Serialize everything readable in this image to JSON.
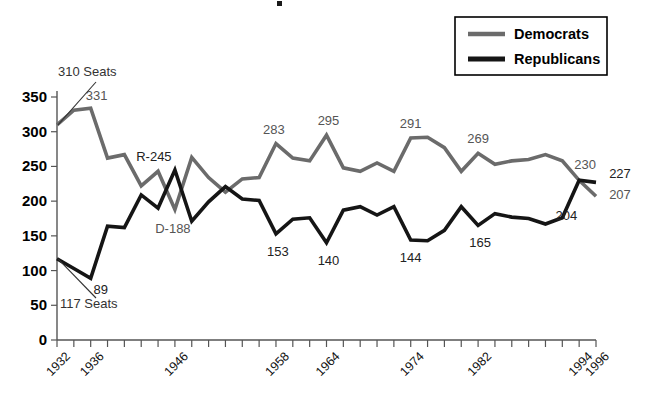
{
  "chart_data": {
    "type": "line",
    "title": "",
    "xlabel": "",
    "ylabel": "",
    "ylim": [
      0,
      350
    ],
    "ytick_values": [
      0,
      50,
      100,
      150,
      200,
      250,
      300,
      350
    ],
    "ytick_labels": [
      "0",
      "50",
      "100",
      "150",
      "200",
      "250",
      "300",
      "350"
    ],
    "grid": false,
    "legend_position": "top-right",
    "x": [
      1932,
      1934,
      1936,
      1938,
      1940,
      1942,
      1944,
      1946,
      1948,
      1950,
      1952,
      1954,
      1956,
      1958,
      1960,
      1962,
      1964,
      1966,
      1968,
      1970,
      1972,
      1974,
      1976,
      1978,
      1980,
      1982,
      1984,
      1986,
      1988,
      1990,
      1992,
      1994,
      1996
    ],
    "xtick_values": [
      1932,
      1934,
      1936,
      1938,
      1940,
      1942,
      1944,
      1946,
      1948,
      1950,
      1952,
      1954,
      1956,
      1958,
      1960,
      1962,
      1964,
      1966,
      1968,
      1970,
      1972,
      1974,
      1976,
      1978,
      1980,
      1982,
      1984,
      1986,
      1988,
      1990,
      1992,
      1994,
      1996
    ],
    "xtick_labels_shown": [
      "1932",
      "1936",
      "1946",
      "1958",
      "1964",
      "1974",
      "1982",
      "1994",
      "1996"
    ],
    "series": [
      {
        "name": "Democrats",
        "color": "#6b6b6b",
        "values": [
          310,
          331,
          334,
          262,
          267,
          222,
          243,
          188,
          263,
          234,
          213,
          232,
          234,
          283,
          262,
          258,
          295,
          248,
          243,
          255,
          243,
          291,
          292,
          277,
          243,
          269,
          253,
          258,
          260,
          267,
          258,
          230,
          207
        ]
      },
      {
        "name": "Republicans",
        "color": "#151515",
        "values": [
          117,
          103,
          89,
          164,
          162,
          209,
          190,
          245,
          171,
          199,
          221,
          203,
          201,
          153,
          174,
          176,
          140,
          187,
          192,
          180,
          192,
          144,
          143,
          158,
          192,
          165,
          182,
          177,
          175,
          167,
          176,
          230,
          227
        ]
      }
    ],
    "data_labels": [
      {
        "text": "331",
        "series": "Democrats",
        "x": 1936,
        "value": 331
      },
      {
        "text": "283",
        "series": "Democrats",
        "x": 1958,
        "value": 283
      },
      {
        "text": "295",
        "series": "Democrats",
        "x": 1964,
        "value": 295
      },
      {
        "text": "291",
        "series": "Democrats",
        "x": 1974,
        "value": 291
      },
      {
        "text": "269",
        "series": "Democrats",
        "x": 1982,
        "value": 269
      },
      {
        "text": "230",
        "series": "Democrats",
        "x": 1994,
        "value": 230
      },
      {
        "text": "207",
        "series": "Democrats",
        "x": 1996,
        "value": 207
      },
      {
        "text": "89",
        "series": "Republicans",
        "x": 1936,
        "value": 89
      },
      {
        "text": "153",
        "series": "Republicans",
        "x": 1958,
        "value": 153
      },
      {
        "text": "140",
        "series": "Republicans",
        "x": 1964,
        "value": 140
      },
      {
        "text": "144",
        "series": "Republicans",
        "x": 1974,
        "value": 144
      },
      {
        "text": "165",
        "series": "Republicans",
        "x": 1982,
        "value": 165
      },
      {
        "text": "204",
        "series": "Republicans",
        "x": 1992,
        "value": 204
      },
      {
        "text": "227",
        "series": "Republicans",
        "x": 1996,
        "value": 227
      },
      {
        "text": "R-245",
        "series": "Republicans",
        "x": 1946,
        "value": 245
      },
      {
        "text": "D-188",
        "series": "Democrats",
        "x": 1946,
        "value": 188
      }
    ],
    "annotations": [
      {
        "text": "310 Seats",
        "series": "Democrats",
        "x": 1932,
        "value": 310
      },
      {
        "text": "117 Seats",
        "series": "Republicans",
        "x": 1932,
        "value": 117
      }
    ]
  },
  "legend": {
    "entries": [
      {
        "label": "Democrats",
        "color": "#6b6b6b"
      },
      {
        "label": "Republicans",
        "color": "#151515"
      }
    ]
  }
}
